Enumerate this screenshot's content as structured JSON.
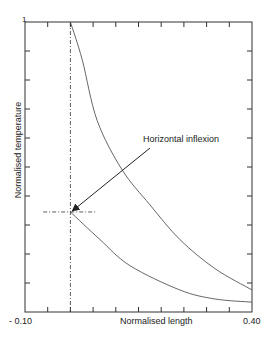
{
  "chart_data": {
    "type": "line",
    "title": "",
    "xlabel": "Normalised length",
    "ylabel": "Normalised temperature",
    "xlim": [
      -0.1,
      0.4
    ],
    "ylim": [
      0,
      1
    ],
    "x_tick_labels": [
      "- 0.10",
      "0.40"
    ],
    "y_tick_labels": [
      "1"
    ],
    "x_tick_step": 0.05,
    "y_tick_step": 0.1,
    "grid": false,
    "legend": null,
    "series": [
      {
        "name": "upper curve",
        "x": [
          0.0,
          0.026,
          0.059,
          0.114,
          0.175,
          0.241,
          0.318,
          0.4
        ],
        "y": [
          1.0,
          0.87,
          0.66,
          0.49,
          0.37,
          0.25,
          0.15,
          0.076
        ]
      },
      {
        "name": "lower curve",
        "x": [
          0.0,
          0.065,
          0.131,
          0.241,
          0.318,
          0.4
        ],
        "y": [
          0.345,
          0.25,
          0.16,
          0.076,
          0.045,
          0.034
        ]
      }
    ],
    "reference_lines": [
      {
        "orientation": "vertical",
        "x": 0.0,
        "style": "dash-dot"
      },
      {
        "orientation": "horizontal",
        "y": 0.345,
        "x_from": -0.06,
        "x_to": 0.055,
        "style": "dash-dot"
      }
    ],
    "annotations": [
      {
        "text": "Horizontal inflexion",
        "arrow_to": {
          "x": 0.0,
          "y": 0.345
        }
      }
    ]
  },
  "labels": {
    "x_min": "- 0.10",
    "x_max": "0.40",
    "y_max": "1",
    "xlabel": "Normalised length",
    "ylabel": "Normalised temperature",
    "annotation": "Horizontal inflexion"
  }
}
